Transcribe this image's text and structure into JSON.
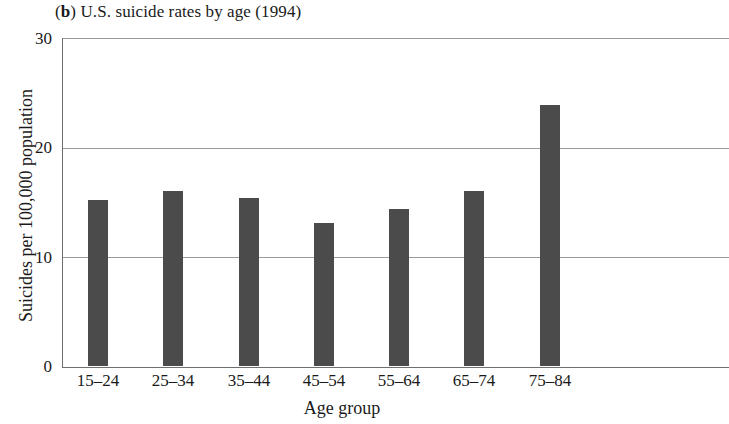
{
  "chart_data": {
    "type": "bar",
    "title": "(b) U.S. suicide rates by age (1994)",
    "panel_letter": "b",
    "title_text": ") U.S. suicide rates by age (1994)",
    "title_prefix": "(",
    "categories": [
      "15–24",
      "25–34",
      "35–44",
      "45–54",
      "55–64",
      "65–74",
      "75–84"
    ],
    "values": [
      15.1,
      16.0,
      15.3,
      13.0,
      14.3,
      16.0,
      23.8
    ],
    "xlabel": "Age group",
    "ylabel": "Suicides per 100,000 population",
    "ylim": [
      0,
      30
    ],
    "yticks": [
      0,
      10,
      20,
      30
    ],
    "ytick_labels": [
      "0",
      "10",
      "20",
      "30"
    ],
    "grid": "horizontal",
    "legend": "none",
    "bar_color": "#4b4b4b",
    "gridline_color": "#9a9a9a",
    "axis_color": "#6f6f6f",
    "background_color": "#ffffff"
  }
}
